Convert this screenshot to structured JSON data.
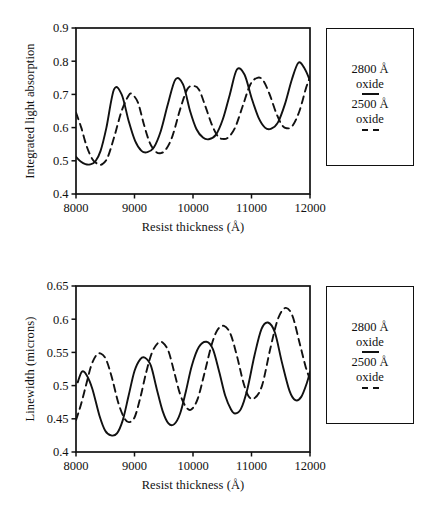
{
  "chart_data": [
    {
      "id": "integrated-light-absorption",
      "type": "line",
      "title": "",
      "xlabel": "Resist thickness (Å)",
      "ylabel": "Integrated light absorption",
      "xlim": [
        8000,
        12000
      ],
      "ylim": [
        0.4,
        0.9
      ],
      "xticks": [
        8000,
        9000,
        10000,
        11000,
        12000
      ],
      "xtick_labels": [
        "8000",
        "9000",
        "10000",
        "11000",
        "12000"
      ],
      "yticks": [
        0.4,
        0.5,
        0.6,
        0.7,
        0.8,
        0.9
      ],
      "ytick_labels": [
        "0.4",
        "0.5",
        "0.6",
        "0.7",
        "0.8",
        "0.9"
      ],
      "grid": false,
      "legend_position": "right-outside",
      "series": [
        {
          "name": "2800 Å oxide",
          "style": "solid",
          "color": "#111111",
          "x": [
            8000,
            8080,
            8160,
            8240,
            8330,
            8420,
            8520,
            8650,
            8780,
            8900,
            9010,
            9120,
            9220,
            9330,
            9450,
            9570,
            9700,
            9830,
            9950,
            10060,
            10170,
            10270,
            10390,
            10510,
            10630,
            10750,
            10880,
            11000,
            11120,
            11230,
            11330,
            11450,
            11570,
            11690,
            11800,
            11900,
            12000
          ],
          "y": [
            0.512,
            0.498,
            0.49,
            0.489,
            0.498,
            0.53,
            0.6,
            0.715,
            0.7,
            0.62,
            0.56,
            0.53,
            0.526,
            0.54,
            0.59,
            0.67,
            0.745,
            0.73,
            0.65,
            0.595,
            0.57,
            0.565,
            0.578,
            0.625,
            0.7,
            0.775,
            0.76,
            0.69,
            0.63,
            0.6,
            0.596,
            0.615,
            0.67,
            0.745,
            0.795,
            0.78,
            0.742
          ]
        },
        {
          "name": "2500 Å oxide",
          "style": "dashed",
          "color": "#111111",
          "x": [
            8000,
            8090,
            8180,
            8280,
            8380,
            8450,
            8540,
            8650,
            8780,
            8900,
            8960,
            9060,
            9160,
            9260,
            9360,
            9450,
            9540,
            9650,
            9780,
            9900,
            10000,
            10100,
            10210,
            10320,
            10420,
            10500,
            10600,
            10720,
            10850,
            10980,
            11100,
            11200,
            11310,
            11420,
            11520,
            11600,
            11700,
            11820,
            11930,
            12000
          ],
          "y": [
            0.645,
            0.6,
            0.545,
            0.505,
            0.49,
            0.49,
            0.51,
            0.57,
            0.65,
            0.697,
            0.7,
            0.675,
            0.61,
            0.555,
            0.528,
            0.523,
            0.535,
            0.575,
            0.655,
            0.715,
            0.725,
            0.715,
            0.665,
            0.61,
            0.575,
            0.566,
            0.57,
            0.6,
            0.665,
            0.73,
            0.75,
            0.742,
            0.7,
            0.645,
            0.608,
            0.598,
            0.605,
            0.65,
            0.718,
            0.752
          ]
        }
      ],
      "legend": {
        "entries": [
          {
            "label_line1": "2800 Å",
            "label_line2": "oxide",
            "style": "solid"
          },
          {
            "label_line1": "2500 Å",
            "label_line2": "oxide",
            "style": "dashed"
          }
        ]
      }
    },
    {
      "id": "linewidth-microns",
      "type": "line",
      "title": "",
      "xlabel": "Resist thickness (Å)",
      "ylabel": "Linewidth (microns)",
      "xlim": [
        8000,
        12000
      ],
      "ylim": [
        0.4,
        0.65
      ],
      "xticks": [
        8000,
        9000,
        10000,
        11000,
        12000
      ],
      "xtick_labels": [
        "8000",
        "9000",
        "10000",
        "11000",
        "12000"
      ],
      "yticks": [
        0.4,
        0.45,
        0.5,
        0.55,
        0.6,
        0.65
      ],
      "ytick_labels": [
        "0.4",
        "0.45",
        "0.5",
        "0.55",
        "0.6",
        "0.65"
      ],
      "grid": false,
      "legend_position": "right-outside",
      "series": [
        {
          "name": "2800 Å oxide",
          "style": "solid",
          "color": "#111111",
          "x": [
            8030,
            8100,
            8180,
            8280,
            8400,
            8500,
            8600,
            8700,
            8800,
            8900,
            9000,
            9100,
            9180,
            9280,
            9380,
            9480,
            9580,
            9680,
            9780,
            9880,
            9980,
            10100,
            10230,
            10340,
            10450,
            10550,
            10650,
            10720,
            10820,
            10930,
            11050,
            11170,
            11280,
            11400,
            11520,
            11650,
            11750,
            11850,
            11950,
            12000
          ],
          "y": [
            0.505,
            0.521,
            0.516,
            0.495,
            0.455,
            0.432,
            0.425,
            0.428,
            0.448,
            0.485,
            0.522,
            0.54,
            0.542,
            0.53,
            0.495,
            0.462,
            0.443,
            0.442,
            0.458,
            0.492,
            0.53,
            0.558,
            0.566,
            0.555,
            0.52,
            0.485,
            0.464,
            0.458,
            0.465,
            0.495,
            0.545,
            0.585,
            0.595,
            0.58,
            0.535,
            0.492,
            0.478,
            0.483,
            0.505,
            0.521
          ]
        },
        {
          "name": "2500 Å oxide",
          "style": "dashed",
          "color": "#111111",
          "x": [
            8000,
            8080,
            8170,
            8260,
            8350,
            8430,
            8520,
            8620,
            8720,
            8820,
            8900,
            9000,
            9100,
            9200,
            9300,
            9400,
            9480,
            9580,
            9680,
            9780,
            9880,
            9970,
            10080,
            10200,
            10320,
            10420,
            10530,
            10640,
            10750,
            10860,
            10950,
            11050,
            11180,
            11320,
            11450,
            11580,
            11700,
            11820,
            11930,
            12000
          ],
          "y": [
            0.448,
            0.47,
            0.5,
            0.53,
            0.546,
            0.548,
            0.538,
            0.51,
            0.475,
            0.452,
            0.445,
            0.452,
            0.482,
            0.52,
            0.55,
            0.564,
            0.565,
            0.552,
            0.52,
            0.487,
            0.468,
            0.464,
            0.48,
            0.52,
            0.562,
            0.584,
            0.59,
            0.578,
            0.545,
            0.505,
            0.484,
            0.481,
            0.5,
            0.555,
            0.6,
            0.617,
            0.605,
            0.565,
            0.527,
            0.51
          ]
        }
      ],
      "legend": {
        "entries": [
          {
            "label_line1": "2800 Å",
            "label_line2": "oxide",
            "style": "solid"
          },
          {
            "label_line1": "2500 Å",
            "label_line2": "oxide",
            "style": "dashed"
          }
        ]
      }
    }
  ]
}
